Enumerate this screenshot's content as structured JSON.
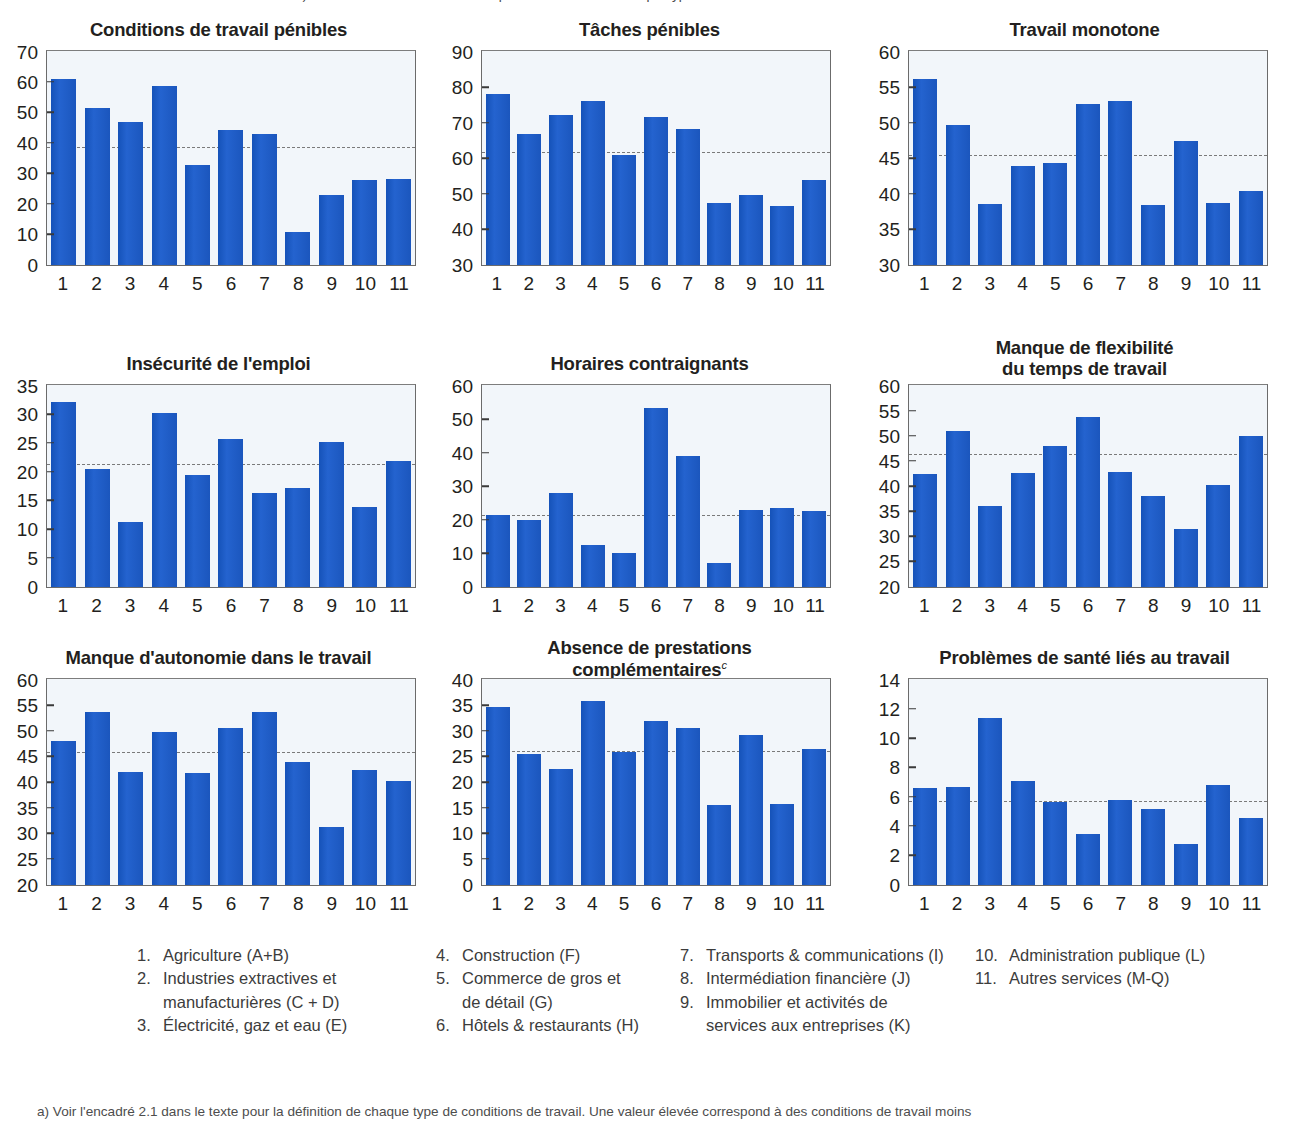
{
  "top_cut_caption": "a) Voir l'encadré 2.1 dans le texte pour la définition de chaque type de conditions de travail",
  "footnote": "a) Voir l'encadré 2.1 dans le texte pour la définition de chaque type de conditions de travail. Une valeur élevée correspond à des conditions de travail moins",
  "colors": {
    "bar": "#1f5fc4",
    "plot_background": "#f2f6fa",
    "plot_border": "#6b6b6b",
    "average_line": "#7a7a7a",
    "text": "#231f20",
    "legend_text": "#3c3c3c"
  },
  "categories": [
    "1",
    "2",
    "3",
    "4",
    "5",
    "6",
    "7",
    "8",
    "9",
    "10",
    "11"
  ],
  "legend": {
    "columns": [
      {
        "items": [
          {
            "num": "1.",
            "text": "Agriculture (A+B)",
            "cont": ""
          },
          {
            "num": "2.",
            "text": "Industries extractives et",
            "cont": "manufacturières (C + D)"
          },
          {
            "num": "3.",
            "text": "Électricité, gaz et eau (E)",
            "cont": ""
          }
        ]
      },
      {
        "items": [
          {
            "num": "4.",
            "text": "Construction (F)",
            "cont": ""
          },
          {
            "num": "5.",
            "text": "Commerce de gros et",
            "cont": "de détail (G)"
          },
          {
            "num": "6.",
            "text": "Hôtels & restaurants (H)",
            "cont": ""
          }
        ]
      },
      {
        "items": [
          {
            "num": "7.",
            "text": "Transports & communications (I)",
            "cont": ""
          },
          {
            "num": "8.",
            "text": "Intermédiation financière (J)",
            "cont": ""
          },
          {
            "num": "9.",
            "text": "Immobilier et activités de",
            "cont": "services aux entreprises (K)"
          }
        ]
      },
      {
        "items": [
          {
            "num": "10.",
            "text": "Administration publique (L)",
            "cont": ""
          },
          {
            "num": "11.",
            "text": "Autres services (M-Q)",
            "cont": ""
          }
        ]
      }
    ]
  },
  "chart_data": [
    {
      "type": "bar",
      "title": "Conditions de travail pénibles",
      "title_sup": "",
      "xlabel": "",
      "ylabel": "",
      "categories": [
        "1",
        "2",
        "3",
        "4",
        "5",
        "6",
        "7",
        "8",
        "9",
        "10",
        "11"
      ],
      "values": [
        61.0,
        51.5,
        47.0,
        58.7,
        33.0,
        44.5,
        43.1,
        10.8,
        23.0,
        27.8,
        28.4
      ],
      "ylim": [
        0,
        70
      ],
      "yticks": [
        0,
        10,
        20,
        30,
        40,
        50,
        60,
        70
      ],
      "average_line": 38.6,
      "grid": false,
      "legend_position": "none"
    },
    {
      "type": "bar",
      "title": "Tâches pénibles",
      "title_sup": "",
      "xlabel": "",
      "ylabel": "",
      "categories": [
        "1",
        "2",
        "3",
        "4",
        "5",
        "6",
        "7",
        "8",
        "9",
        "10",
        "11"
      ],
      "values": [
        78.1,
        67.0,
        72.2,
        76.2,
        61.0,
        71.6,
        68.4,
        47.6,
        49.7,
        46.6,
        54.0
      ],
      "ylim": [
        30,
        90
      ],
      "yticks": [
        30,
        40,
        50,
        60,
        70,
        80,
        90
      ],
      "average_line": 61.6,
      "grid": false,
      "legend_position": "none"
    },
    {
      "type": "bar",
      "title": "Travail monotone",
      "title_sup": "",
      "xlabel": "",
      "ylabel": "",
      "categories": [
        "1",
        "2",
        "3",
        "4",
        "5",
        "6",
        "7",
        "8",
        "9",
        "10",
        "11"
      ],
      "values": [
        56.2,
        49.7,
        38.6,
        44.0,
        44.4,
        52.7,
        53.1,
        38.4,
        47.4,
        38.8,
        40.4
      ],
      "ylim": [
        30,
        60
      ],
      "yticks": [
        30,
        35,
        40,
        45,
        50,
        55,
        60
      ],
      "average_line": 45.4,
      "grid": false,
      "legend_position": "none"
    },
    {
      "type": "bar",
      "title": "Insécurité de l'emploi",
      "title_sup": "",
      "xlabel": "",
      "ylabel": "",
      "categories": [
        "1",
        "2",
        "3",
        "4",
        "5",
        "6",
        "7",
        "8",
        "9",
        "10",
        "11"
      ],
      "values": [
        32.2,
        20.6,
        11.4,
        30.3,
        19.5,
        25.8,
        16.4,
        17.3,
        25.3,
        14.0,
        21.9
      ],
      "ylim": [
        0,
        35
      ],
      "yticks": [
        0,
        5,
        10,
        15,
        20,
        25,
        30,
        35
      ],
      "average_line": 21.3,
      "grid": false,
      "legend_position": "none"
    },
    {
      "type": "bar",
      "title": "Horaires contraignants",
      "title_sup": "",
      "xlabel": "",
      "ylabel": "",
      "categories": [
        "1",
        "2",
        "3",
        "4",
        "5",
        "6",
        "7",
        "8",
        "9",
        "10",
        "11"
      ],
      "values": [
        21.6,
        20.1,
        28.0,
        12.5,
        10.3,
        53.4,
        39.1,
        7.3,
        22.9,
        23.5,
        22.7
      ],
      "ylim": [
        0,
        60
      ],
      "yticks": [
        0,
        10,
        20,
        30,
        40,
        50,
        60
      ],
      "average_line": 21.2,
      "grid": false,
      "legend_position": "none"
    },
    {
      "type": "bar",
      "title": "Manque de flexibilité\ndu temps de travail",
      "title_sup": "",
      "xlabel": "",
      "ylabel": "",
      "categories": [
        "1",
        "2",
        "3",
        "4",
        "5",
        "6",
        "7",
        "8",
        "9",
        "10",
        "11"
      ],
      "values": [
        42.4,
        51.0,
        36.2,
        42.7,
        48.0,
        53.9,
        42.9,
        38.1,
        31.6,
        40.4,
        50.0
      ],
      "ylim": [
        20,
        60
      ],
      "yticks": [
        20,
        25,
        30,
        35,
        40,
        45,
        50,
        55,
        60
      ],
      "average_line": 46.2,
      "grid": false,
      "legend_position": "none"
    },
    {
      "type": "bar",
      "title": "Manque d'autonomie dans le travail",
      "title_sup": "",
      "xlabel": "",
      "ylabel": "",
      "categories": [
        "1",
        "2",
        "3",
        "4",
        "5",
        "6",
        "7",
        "8",
        "9",
        "10",
        "11"
      ],
      "values": [
        48.1,
        53.8,
        42.1,
        49.8,
        41.9,
        50.6,
        53.8,
        44.1,
        31.3,
        42.5,
        40.3
      ],
      "ylim": [
        20,
        60
      ],
      "yticks": [
        20,
        25,
        30,
        35,
        40,
        45,
        50,
        55,
        60
      ],
      "average_line": 45.8,
      "grid": false,
      "legend_position": "none"
    },
    {
      "type": "bar",
      "title": "Absence de prestations\ncomplémentaires",
      "title_sup": "c",
      "xlabel": "",
      "ylabel": "",
      "categories": [
        "1",
        "2",
        "3",
        "4",
        "5",
        "6",
        "7",
        "8",
        "9",
        "10",
        "11"
      ],
      "values": [
        34.7,
        25.5,
        22.7,
        36.0,
        26.0,
        32.0,
        30.6,
        15.6,
        29.2,
        15.9,
        26.6
      ],
      "ylim": [
        0,
        40
      ],
      "yticks": [
        0,
        5,
        10,
        15,
        20,
        25,
        30,
        35,
        40
      ],
      "average_line": 26.0,
      "grid": false,
      "legend_position": "none"
    },
    {
      "type": "bar",
      "title": "Problèmes de santé liés au travail",
      "title_sup": "",
      "xlabel": "",
      "ylabel": "",
      "categories": [
        "1",
        "2",
        "3",
        "4",
        "5",
        "6",
        "7",
        "8",
        "9",
        "10",
        "11"
      ],
      "values": [
        6.6,
        6.7,
        11.4,
        7.1,
        5.7,
        3.5,
        5.8,
        5.2,
        2.8,
        6.8,
        4.6
      ],
      "ylim": [
        0,
        14
      ],
      "yticks": [
        0,
        2,
        4,
        6,
        8,
        10,
        12,
        14
      ],
      "average_line": 5.7,
      "grid": false,
      "legend_position": "none"
    }
  ]
}
